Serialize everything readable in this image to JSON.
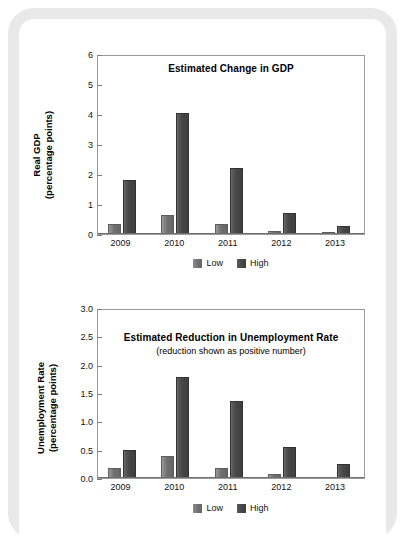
{
  "figure": {
    "background_color": "#ffffff",
    "frame_color": "#e9e9e9"
  },
  "chart_data": [
    {
      "type": "bar",
      "id": "gdp",
      "title": "Estimated Change in GDP",
      "subtitle": "",
      "xlabel": "",
      "ylabel": "Real GDP\n(percentage points)",
      "ylabel_line1": "Real GDP",
      "ylabel_line2": "(percentage points)",
      "categories": [
        "2009",
        "2010",
        "2011",
        "2012",
        "2013"
      ],
      "ylim": [
        0,
        6
      ],
      "yticks": [
        "0",
        "1",
        "2",
        "3",
        "4",
        "5",
        "6"
      ],
      "ytick_values": [
        0,
        1,
        2,
        3,
        4,
        5,
        6
      ],
      "grid": false,
      "legend_position": "bottom",
      "series": [
        {
          "name": "Low",
          "color": "#6f6f6f",
          "values": [
            0.35,
            0.65,
            0.35,
            0.1,
            0.07
          ]
        },
        {
          "name": "High",
          "color": "#474747",
          "values": [
            1.8,
            4.05,
            2.2,
            0.7,
            0.27
          ]
        }
      ]
    },
    {
      "type": "bar",
      "id": "unemployment",
      "title": "Estimated Reduction in Unemployment Rate",
      "subtitle": "(reduction shown as positive number)",
      "xlabel": "",
      "ylabel": "Unemployment Rate\n(percentage points)",
      "ylabel_line1": "Unemployment Rate",
      "ylabel_line2": "(percentage points)",
      "categories": [
        "2009",
        "2010",
        "2011",
        "2012",
        "2013"
      ],
      "ylim": [
        0,
        3.0
      ],
      "yticks": [
        "0.0",
        "0.5",
        "1.0",
        "1.5",
        "2.0",
        "2.5",
        "3.0"
      ],
      "ytick_values": [
        0,
        0.5,
        1.0,
        1.5,
        2.0,
        2.5,
        3.0
      ],
      "grid": false,
      "legend_position": "bottom",
      "series": [
        {
          "name": "Low",
          "color": "#6f6f6f",
          "values": [
            0.18,
            0.39,
            0.17,
            0.07,
            0
          ]
        },
        {
          "name": "High",
          "color": "#474747",
          "values": [
            0.49,
            1.79,
            1.36,
            0.55,
            0.25
          ]
        }
      ]
    }
  ]
}
